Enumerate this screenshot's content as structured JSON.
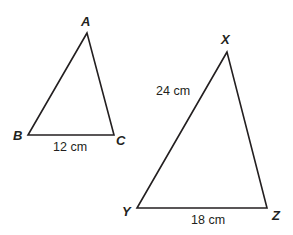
{
  "diagram": {
    "triangles": [
      {
        "name": "ABC",
        "vertices": [
          {
            "label": "A",
            "x": 87,
            "y": 33
          },
          {
            "label": "B",
            "x": 28,
            "y": 135
          },
          {
            "label": "C",
            "x": 114,
            "y": 135
          }
        ],
        "side_labels": [
          {
            "side": "BC",
            "text": "12 cm"
          }
        ]
      },
      {
        "name": "XYZ",
        "vertices": [
          {
            "label": "X",
            "x": 227,
            "y": 52
          },
          {
            "label": "Y",
            "x": 137,
            "y": 208
          },
          {
            "label": "Z",
            "x": 267,
            "y": 208
          }
        ],
        "side_labels": [
          {
            "side": "XY",
            "text": "24 cm"
          },
          {
            "side": "YZ",
            "text": "18 cm"
          }
        ]
      }
    ],
    "stroke_color": "#231f20",
    "background_color": "#ffffff"
  }
}
